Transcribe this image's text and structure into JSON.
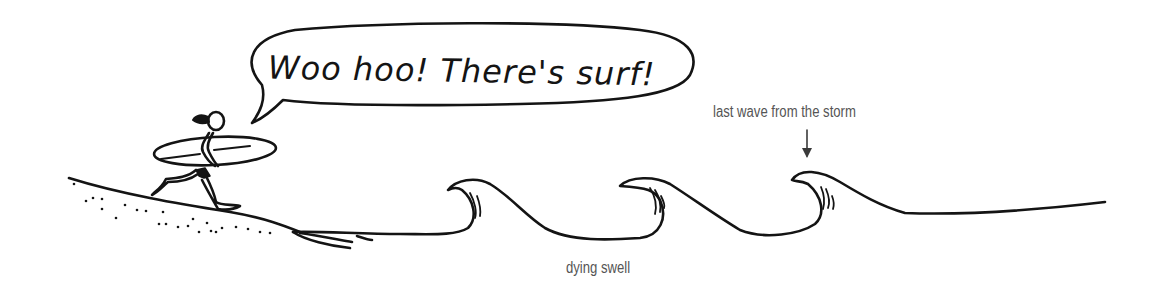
{
  "illustration": {
    "speech_bubble": {
      "text": "Woo hoo! There's surf!"
    },
    "annotations": {
      "last_wave": "last wave from the storm",
      "dying_swell": "dying swell"
    },
    "elements": [
      "surfer-running-with-surfboard",
      "sandy-beach-slope",
      "wave-1",
      "wave-2",
      "wave-3-last-from-storm",
      "flat-sea",
      "down-arrow"
    ]
  },
  "colors": {
    "ink": "#141414",
    "label": "#555555",
    "background": "#ffffff"
  }
}
